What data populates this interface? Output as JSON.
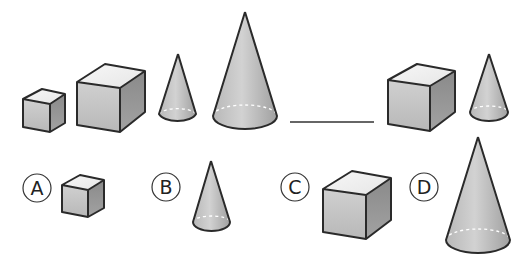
{
  "question": {
    "sequence": [
      {
        "shape": "cube",
        "size": "small"
      },
      {
        "shape": "cube",
        "size": "large"
      },
      {
        "shape": "cone",
        "size": "small"
      },
      {
        "shape": "cone",
        "size": "large"
      }
    ],
    "blank": "____",
    "analog": [
      {
        "shape": "cube",
        "size": "large"
      },
      {
        "shape": "cone",
        "size": "small"
      }
    ]
  },
  "options": [
    {
      "label": "A",
      "shape": "cube",
      "size": "small"
    },
    {
      "label": "B",
      "shape": "cone",
      "size": "small"
    },
    {
      "label": "C",
      "shape": "cube",
      "size": "large"
    },
    {
      "label": "D",
      "shape": "cone",
      "size": "large"
    }
  ],
  "colors": {
    "outline": "#2a2a2a",
    "cube_top": "#f2f2f2",
    "cube_front": "#c4c4c4",
    "cube_side": "#8e8e8e",
    "cone_light": "#cfcfcf",
    "cone_dark": "#9a9a9a",
    "dashed_base": "#ffffff"
  }
}
